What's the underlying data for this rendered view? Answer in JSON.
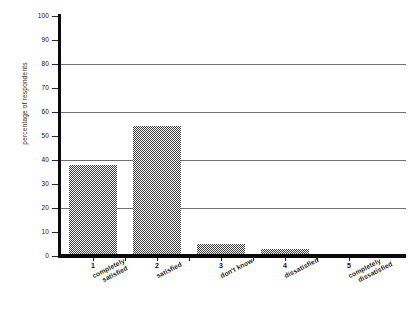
{
  "chart_data": {
    "type": "bar",
    "title": "",
    "subtitle": "",
    "xlabel": "",
    "ylabel": "percentage of respondents",
    "ylim": [
      0,
      100
    ],
    "ytick_step": 10,
    "gridlines": [
      20,
      40,
      60,
      80
    ],
    "grid": true,
    "legend": "none",
    "categories": [
      "completely satisfied",
      "satisfied",
      "don't know",
      "dissatisfied",
      "completely dissatisfied"
    ],
    "category_numbers": [
      "1",
      "2",
      "3",
      "4",
      "5"
    ],
    "category_lines": [
      [
        "completely",
        "satisfied"
      ],
      [
        "satisfied"
      ],
      [
        "don't know"
      ],
      [
        "dissatisfied"
      ],
      [
        "completely",
        "dissatisfied"
      ]
    ],
    "values": [
      38,
      54,
      5,
      3,
      0
    ],
    "ytick_labels": [
      "0",
      "10",
      "20",
      "30",
      "40",
      "50",
      "60",
      "70",
      "80",
      "90",
      "100"
    ],
    "bar_fill": "#3d3d3d",
    "axis_color": "#0a0a0a",
    "grid_color": "#6f6f6f",
    "background": "#ffffff"
  }
}
